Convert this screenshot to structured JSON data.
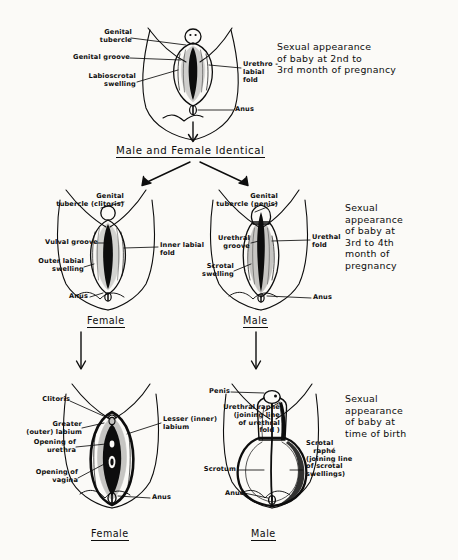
{
  "figure": {
    "background_color": "#fbfaf7",
    "ink_color": "#0d0d0d"
  },
  "stage_top": {
    "caption": "Sexual appearance\nof baby at 2nd to\n3rd month of pregnancy",
    "labels": {
      "genital_tubercle": "Genital\n  tubercle",
      "genital_groove": "Genital groove",
      "labioscrotal_swelling": "Labioscrotal\n   swelling",
      "urethro_labial_fold": "Urethro -\nlabial\nfold",
      "anus": "Anus"
    }
  },
  "divider": {
    "text": "Male and Female Identical"
  },
  "stage_middle": {
    "caption": "Sexual\nappearance\nof baby at\n3rd to 4th\nmonth of\npregnancy",
    "female": {
      "name": "Female",
      "labels": {
        "genital_tubercle": "Genital\ntubercle (clitoris)",
        "vulval_groove": "Vulval groove",
        "outer_labial_swelling": "Outer labial\n  swelling",
        "inner_labial_fold": "Inner labial\nfold",
        "anus": "Anus"
      }
    },
    "male": {
      "name": "Male",
      "labels": {
        "genital_tubercle": "Genital\ntubercle (penis)",
        "urethral_groove": "Urethral\n groove",
        "scrotal_swelling": "Scrotal\n swelling",
        "urethral_fold": "Urethal\nfold",
        "anus": "Anus"
      }
    }
  },
  "stage_bottom": {
    "caption": "Sexual\nappearance\nof baby at\ntime of birth",
    "female": {
      "name": "Female",
      "labels": {
        "clitoris": "Clitoris",
        "greater_outer_labium": "Greater\n(outer) labium",
        "opening_of_urethra": "Opening of\n  urethra",
        "opening_of_vagina": "Opening of\n  vagina",
        "lesser_inner_labium": "Lesser (inner)\nlabium",
        "anus": "Anus"
      }
    },
    "male": {
      "name": "Male",
      "labels": {
        "penis": "Penis",
        "urethral_raphe": "Urethral raphé\n(joining line\nof urethral\nfold )",
        "scrotum": "Scrotum",
        "scrotal_raphe": "Scrotal\n   raphé\n(joining line\nof scrotal\nswellings)",
        "anus": "Anus"
      }
    }
  }
}
